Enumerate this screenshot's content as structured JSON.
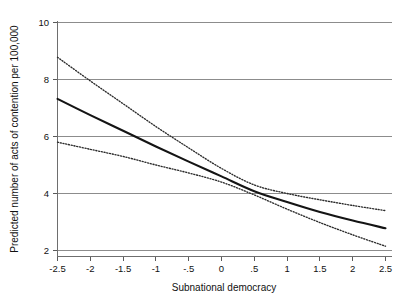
{
  "chart_data": {
    "type": "line",
    "title": "",
    "xlabel": "Subnational democracy",
    "ylabel": "Predicted number of acts of contention per 100,000",
    "xlim": [
      -2.5,
      2.5
    ],
    "ylim": [
      2,
      10
    ],
    "grid": true,
    "legend_position": "none",
    "xticks": [
      -2.5,
      -2,
      -1.5,
      -1,
      -0.5,
      0,
      0.5,
      1,
      1.5,
      2,
      2.5
    ],
    "xtick_labels": [
      "-2.5",
      "-2",
      "-1.5",
      "-1",
      "-.5",
      "0",
      ".5",
      "1",
      "1.5",
      "2",
      "2.5"
    ],
    "yticks": [
      2,
      4,
      6,
      8,
      10
    ],
    "ytick_labels": [
      "2",
      "4",
      "6",
      "8",
      "10"
    ],
    "x": [
      -2.5,
      -2,
      -1.5,
      -1,
      -0.5,
      0,
      0.5,
      1,
      1.5,
      2,
      2.5
    ],
    "series": [
      {
        "name": "Predicted value",
        "style": "solid",
        "color": "#141414",
        "values": [
          7.32,
          6.75,
          6.2,
          5.65,
          5.12,
          4.6,
          4.08,
          3.7,
          3.35,
          3.05,
          2.78
        ]
      },
      {
        "name": "Upper 95% confidence limit",
        "style": "dotted",
        "color": "#2b2b2b",
        "values": [
          8.78,
          7.95,
          7.15,
          6.35,
          5.6,
          4.88,
          4.3,
          4.0,
          3.78,
          3.58,
          3.4
        ]
      },
      {
        "name": "Lower 95% confidence limit",
        "style": "dotted",
        "color": "#2b2b2b",
        "values": [
          5.8,
          5.55,
          5.3,
          5.0,
          4.72,
          4.4,
          3.95,
          3.45,
          2.98,
          2.55,
          2.15
        ]
      }
    ]
  },
  "axes": {
    "x_title": "Subnational democracy",
    "y_title": "Predicted number of acts of contention per 100,000"
  }
}
